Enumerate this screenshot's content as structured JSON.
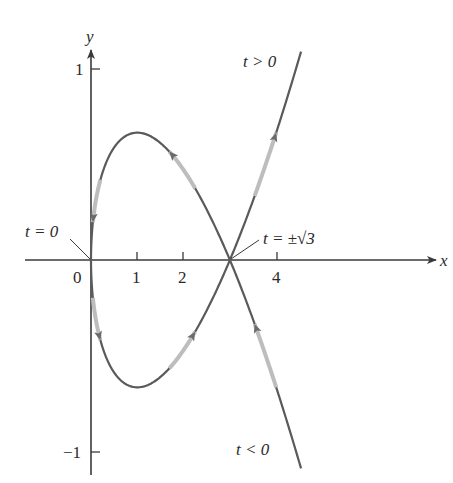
{
  "diagram": {
    "type": "parametric-curve",
    "equations": "x = t^2, y = (t^3 - 3t)/3",
    "axes": {
      "x_label": "x",
      "y_label": "y",
      "x_ticks": [
        {
          "value": 0,
          "label": "0"
        },
        {
          "value": 1,
          "label": "1"
        },
        {
          "value": 2,
          "label": "2"
        },
        {
          "value": 4,
          "label": "4"
        }
      ],
      "y_ticks": [
        {
          "value": 1,
          "label": "1"
        },
        {
          "value": -1,
          "label": "−1"
        }
      ]
    },
    "annotations": {
      "t_zero": "t = 0",
      "t_cross": "t = ±√3",
      "t_pos": "t > 0",
      "t_neg": "t < 0"
    },
    "colors": {
      "axis": "#3a3a3a",
      "curve": "#5a5a5a",
      "highlight": "#c8c8c8",
      "text": "#2a2a2a"
    }
  }
}
